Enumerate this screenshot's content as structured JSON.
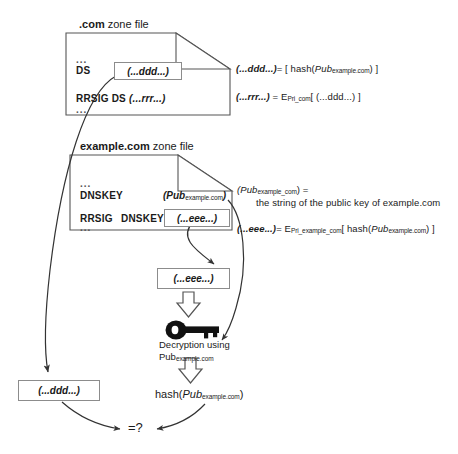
{
  "diagram": {
    "com_zone": {
      "file_label_bold": ".com",
      "file_label_rest": " zone file",
      "ellipsis_top": "...",
      "ellipsis_bottom": "...",
      "ds_label": "DS",
      "ds_value": "(...ddd...)",
      "rrsig_label": "RRSIG DS",
      "rrsig_value": "(...rrr...)"
    },
    "example_zone": {
      "file_label_bold": "example.com",
      "file_label_rest": " zone file",
      "ellipsis_top": "...",
      "ellipsis_bottom": "...",
      "dnskey_label": "DNSKEY",
      "dnskey_value_main": "(Pub",
      "dnskey_value_sub": "example.com",
      "dnskey_value_close": ")",
      "rrsig_label": "RRSIG",
      "rrsig_type": "DNSKEY",
      "rrsig_value": "(...eee...)"
    },
    "equations": {
      "ddd_lhs": "(...ddd...)",
      "ddd_eq": "= [ hash(",
      "ddd_pub": "Pub",
      "ddd_sub": "example.com",
      "ddd_tail": ") ]",
      "rrr_lhs": "(...rrr...)",
      "rrr_eq": "= E",
      "rrr_sub": "Pri_com",
      "rrr_tail": "[ (...ddd...) ]",
      "pub_lhs": "(Pub",
      "pub_lhs_sub": "example_com",
      "pub_lhs_close": ") =",
      "pub_desc": "the string of the public key of example.com",
      "eee_lhs": "(...eee...)",
      "eee_eq": "= E",
      "eee_sub": "Pri_example_com",
      "eee_mid": "[ hash(",
      "eee_pub": "Pub",
      "eee_pub_sub": "example.com",
      "eee_tail": ") ]"
    },
    "decryption": {
      "signature_box": "(...eee...)",
      "caption_line1": "Decryption using",
      "caption_line2_main": "Pub",
      "caption_line2_sub": "example.com",
      "key_icon": "key-icon"
    },
    "comparison": {
      "left_value": "(...ddd...)",
      "right_main": "hash(",
      "right_pub": "Pub",
      "right_sub": "example.com",
      "right_tail": ")",
      "equals_question": "=?"
    }
  },
  "colors": {
    "stroke": "#555555",
    "box_border": "#8c8c8c",
    "arrow": "#333333",
    "key_fill": "#111111",
    "background": "#ffffff",
    "text": "#1a1a1a"
  }
}
